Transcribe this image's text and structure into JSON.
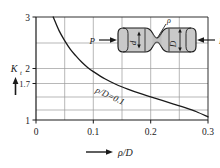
{
  "chart_data": {
    "type": "line",
    "title": "",
    "xlabel": "ρ/D",
    "ylabel": "K",
    "ylabel_sub": "t",
    "xlim": [
      0,
      0.3
    ],
    "ylim": [
      1,
      3
    ],
    "grid": true,
    "legend": "none",
    "x_ticks": [
      "0",
      "0.1",
      "0.2",
      "0.3"
    ],
    "x_tick_values": [
      0,
      0.1,
      0.2,
      0.3
    ],
    "x_gridlines": [
      0.05,
      0.1,
      0.15,
      0.2,
      0.25
    ],
    "y_ticks": [
      "3",
      "2",
      "1.7",
      "1"
    ],
    "y_tick_values": [
      3,
      2,
      1.7,
      1
    ],
    "y_gridlines": [
      1.2,
      1.45,
      1.7,
      2,
      2.5
    ],
    "series": [
      {
        "name": "d/D=0.1",
        "annotation": "ρ/D=0.1",
        "x": [
          0.03,
          0.04,
          0.05,
          0.06,
          0.07,
          0.08,
          0.09,
          0.1,
          0.12,
          0.14,
          0.16,
          0.18,
          0.2,
          0.22,
          0.24,
          0.26,
          0.28,
          0.3
        ],
        "y": [
          3.0,
          2.74,
          2.54,
          2.37,
          2.24,
          2.12,
          2.02,
          1.94,
          1.8,
          1.69,
          1.6,
          1.52,
          1.45,
          1.38,
          1.31,
          1.24,
          1.16,
          1.06
        ]
      }
    ],
    "annotations": [
      {
        "name": "curve-label",
        "text": "ρ/D=0.1"
      }
    ]
  },
  "axis": {
    "y_label_main": "K",
    "y_label_sub": "t",
    "y_tick_3": "3",
    "y_tick_2": "2",
    "y_tick_17": "1.7",
    "y_tick_1": "1",
    "x_tick_0": "0",
    "x_tick_01": "0.1",
    "x_tick_02": "0.2",
    "x_tick_03": "0.3",
    "x_axis_title": "ρ/D"
  },
  "curve": {
    "label": "ρ/D=0.1"
  },
  "inset": {
    "load_left": "P",
    "load_right": "P",
    "dim_small": "d",
    "dim_large": "D",
    "radius_label": "ρ",
    "fill_color": "#c9c9c9",
    "edge_color": "#1a1a1a"
  },
  "colors": {
    "curve": "#1a1a1a",
    "grid": "#9a9a9a",
    "axis": "#1a1a1a",
    "background": "#ffffff"
  }
}
